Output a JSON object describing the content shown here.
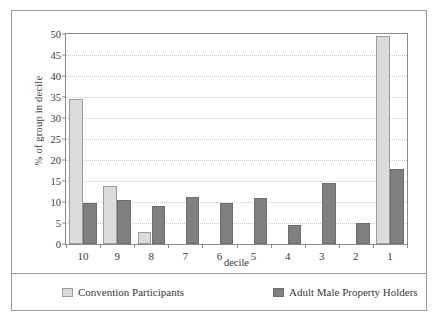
{
  "chart_data": {
    "type": "bar",
    "title": "",
    "xlabel": "decile",
    "ylabel": "% of group in decile",
    "categories": [
      "10",
      "9",
      "8",
      "7",
      "6",
      "5",
      "4",
      "3",
      "2",
      "1"
    ],
    "series": [
      {
        "name": "Convention Participants",
        "color": "#dcdcdc",
        "values": [
          34.5,
          13.7,
          2.8,
          0,
          0,
          0,
          0,
          0,
          0,
          49.5
        ]
      },
      {
        "name": "Adult Male Property Holders",
        "color": "#808080",
        "values": [
          9.8,
          10.4,
          9.1,
          11.2,
          9.7,
          11.0,
          4.5,
          14.6,
          5.1,
          17.9
        ]
      }
    ],
    "ylim": [
      0,
      50
    ],
    "yticks": [
      0,
      5,
      10,
      15,
      20,
      25,
      30,
      35,
      40,
      45,
      50
    ],
    "ytick_labels": [
      "0",
      "5",
      "10",
      "15",
      "20",
      "25",
      "30",
      "35",
      "40",
      "45",
      "50"
    ],
    "grid": true,
    "grid_axis": "y",
    "legend_position": "bottom",
    "frame": true
  }
}
